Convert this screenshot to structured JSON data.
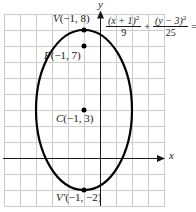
{
  "diagram": {
    "axis_labels": {
      "x": "x",
      "y": "y"
    },
    "points": [
      {
        "name": "vertex-top",
        "letter": "V",
        "coords": "(−1, 8)",
        "x": -1,
        "y": 8
      },
      {
        "name": "focus",
        "letter": "F",
        "coords": "(−1, 7)",
        "x": -1,
        "y": 7
      },
      {
        "name": "center",
        "letter": "C",
        "coords": "(−1, 3)",
        "x": -1,
        "y": 3
      },
      {
        "name": "vertex-bottom",
        "letter": "V′",
        "coords": "(−1, −2)",
        "x": -1,
        "y": -2
      }
    ],
    "equation": {
      "term1_numerator": "(x + 1)",
      "term1_exponent": "2",
      "term1_denominator": "9",
      "operator": "+",
      "term2_numerator": "(y − 3)",
      "term2_exponent": "2",
      "term2_denominator": "25",
      "result": "= 1"
    },
    "ellipse": {
      "center": [
        -1,
        3
      ],
      "semi_major_axis": 5,
      "semi_minor_axis": 3,
      "orientation": "vertical"
    },
    "colors": {
      "grid": "#cccccc",
      "axis": "#1a1a1a",
      "curve": "#000000",
      "background": "#ffffff"
    }
  }
}
